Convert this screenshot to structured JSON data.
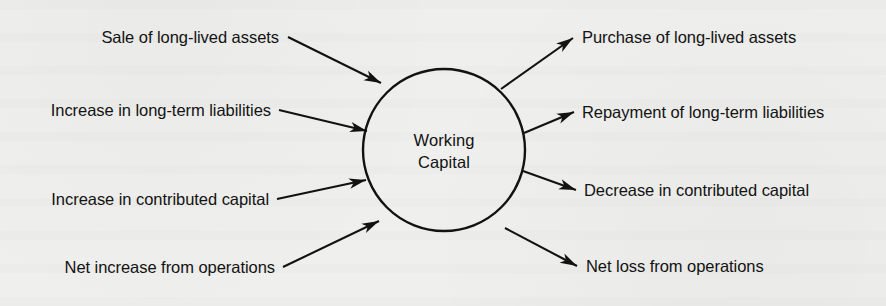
{
  "diagram": {
    "type": "hub-and-spoke",
    "center_node": {
      "label_line1": "Working",
      "label_line2": "Capital",
      "shape": "circle",
      "stroke_color": "#121212"
    },
    "background_color": "#efefed",
    "ink_color": "#121212",
    "inflows": [
      {
        "label": "Sale of long-lived assets",
        "direction": "in"
      },
      {
        "label": "Increase in long-term liabilities",
        "direction": "in"
      },
      {
        "label": "Increase in contributed capital",
        "direction": "in"
      },
      {
        "label": "Net increase from operations",
        "direction": "in"
      }
    ],
    "outflows": [
      {
        "label": "Purchase of long-lived assets",
        "direction": "out"
      },
      {
        "label": "Repayment of long-term liabilities",
        "direction": "out"
      },
      {
        "label": "Decrease in contributed capital",
        "direction": "out"
      },
      {
        "label": "Net loss from operations",
        "direction": "out"
      }
    ]
  }
}
